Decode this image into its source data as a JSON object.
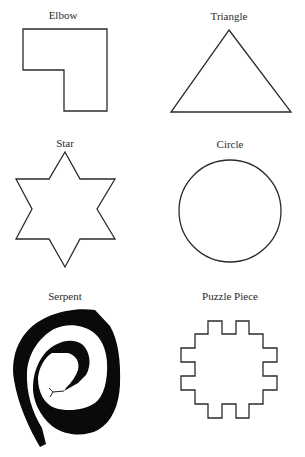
{
  "figure": {
    "shapes": [
      {
        "id": "elbow",
        "label": "Elbow",
        "style": "outline"
      },
      {
        "id": "triangle",
        "label": "Triangle",
        "style": "outline"
      },
      {
        "id": "star",
        "label": "Star",
        "style": "outline"
      },
      {
        "id": "circle",
        "label": "Circle",
        "style": "outline"
      },
      {
        "id": "serpent",
        "label": "Serpent",
        "style": "filled"
      },
      {
        "id": "puzzle-piece",
        "label": "Puzzle Piece",
        "style": "outline"
      }
    ],
    "colors": {
      "stroke": "#2b2b2b",
      "fill_solid": "#0a0a0a",
      "background": "#ffffff"
    }
  }
}
